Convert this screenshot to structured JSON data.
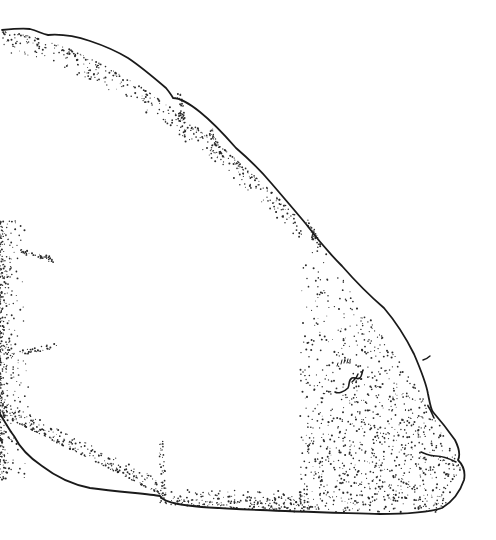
{
  "illustration": {
    "subject": "stippled ink drawing of specimen outline (lateral view)",
    "background_color": "#ffffff",
    "ink_color": "#1a1a1a",
    "stipple_color": "#2a2a2a"
  }
}
